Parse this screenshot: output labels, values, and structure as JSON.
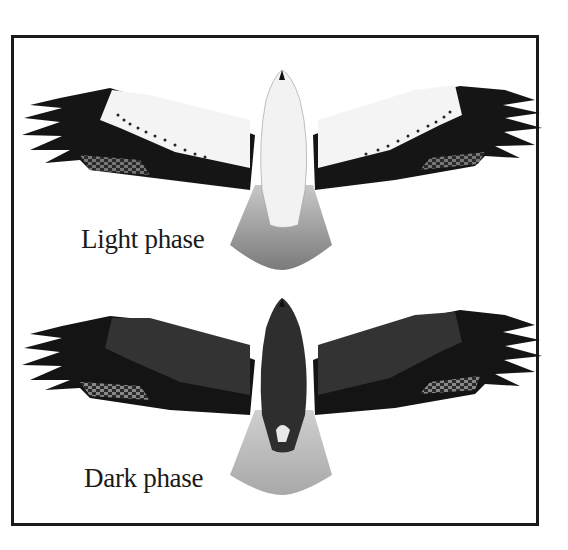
{
  "illustration": {
    "frame_color": "#1a1a1a",
    "birds": [
      {
        "id": "light",
        "label": "Light phase",
        "body_color": "#f2f2f2",
        "wing_color": "#151515",
        "tail_color": "#8a8a8a"
      },
      {
        "id": "dark",
        "label": "Dark phase",
        "body_color": "#2e2e2e",
        "wing_color": "#111111",
        "tail_color": "#b5b5b5"
      }
    ]
  }
}
